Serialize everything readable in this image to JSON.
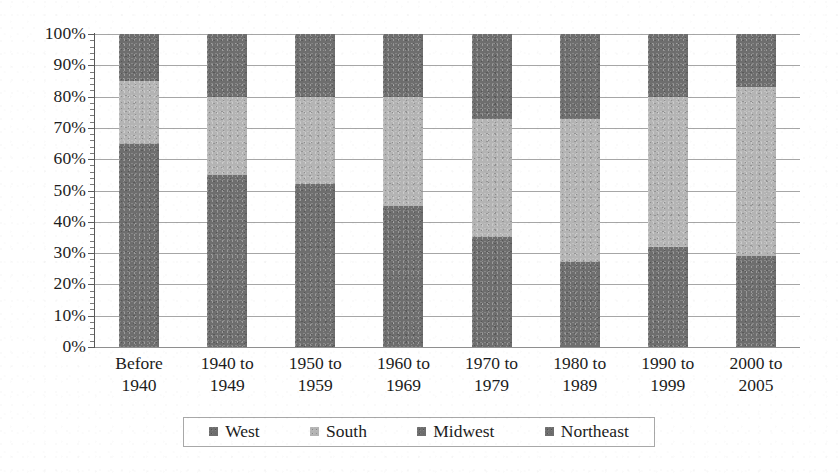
{
  "chart_data": {
    "type": "bar",
    "variant": "stacked-100-percent",
    "title": "",
    "subtitle": "",
    "xlabel": "",
    "ylabel": "",
    "ylim": [
      0,
      100
    ],
    "y_unit": "%",
    "grid": true,
    "legend_position": "bottom",
    "stack_order_bottom_to_top": [
      "Northeast",
      "Midwest",
      "South",
      "West"
    ],
    "categories": [
      "Before 1940",
      "1940 to 1949",
      "1950 to 1959",
      "1960 to 1969",
      "1970 to 1979",
      "1980 to 1989",
      "1990 to 1999",
      "2000 to 2005"
    ],
    "category_lines": [
      [
        "Before",
        "1940"
      ],
      [
        "1940 to",
        "1949"
      ],
      [
        "1950 to",
        "1959"
      ],
      [
        "1960 to",
        "1969"
      ],
      [
        "1970 to",
        "1979"
      ],
      [
        "1980 to",
        "1989"
      ],
      [
        "1990 to",
        "1999"
      ],
      [
        "2000 to",
        "2005"
      ]
    ],
    "ytick_labels": [
      "0%",
      "10%",
      "20%",
      "30%",
      "40%",
      "50%",
      "60%",
      "70%",
      "80%",
      "90%",
      "100%"
    ],
    "ytick_values": [
      0,
      10,
      20,
      30,
      40,
      50,
      60,
      70,
      80,
      90,
      100
    ],
    "series": [
      {
        "name": "West",
        "color": "#6e6e6e",
        "values": [
          15,
          20,
          20,
          20,
          27,
          27,
          20,
          17
        ]
      },
      {
        "name": "South",
        "color": "#b4b4b4",
        "values": [
          20,
          25,
          28,
          35,
          38,
          46,
          48,
          54
        ]
      },
      {
        "name": "Midwest",
        "color": "#6e6e6e",
        "values": [
          30,
          26,
          24,
          21,
          16,
          13,
          14,
          12
        ]
      },
      {
        "name": "Northeast",
        "color": "#6e6e6e",
        "values": [
          35,
          29,
          28,
          24,
          19,
          14,
          18,
          17
        ]
      }
    ],
    "segment_boundaries_percent": {
      "Before 1940": {
        "northeast": [
          0,
          35
        ],
        "midwest": [
          35,
          65
        ],
        "south": [
          65,
          85
        ],
        "west": [
          85,
          100
        ]
      },
      "1940 to 1949": {
        "northeast": [
          0,
          29
        ],
        "midwest": [
          29,
          55
        ],
        "south": [
          55,
          80
        ],
        "west": [
          80,
          100
        ]
      },
      "1950 to 1959": {
        "northeast": [
          0,
          28
        ],
        "midwest": [
          28,
          52
        ],
        "south": [
          52,
          80
        ],
        "west": [
          80,
          100
        ]
      },
      "1960 to 1969": {
        "northeast": [
          0,
          24
        ],
        "midwest": [
          24,
          45
        ],
        "south": [
          45,
          80
        ],
        "west": [
          80,
          100
        ]
      },
      "1970 to 1979": {
        "northeast": [
          0,
          19
        ],
        "midwest": [
          19,
          35
        ],
        "south": [
          35,
          73
        ],
        "west": [
          73,
          100
        ]
      },
      "1980 to 1989": {
        "northeast": [
          0,
          14
        ],
        "midwest": [
          14,
          27
        ],
        "south": [
          27,
          73
        ],
        "west": [
          73,
          100
        ]
      },
      "1990 to 1999": {
        "northeast": [
          0,
          18
        ],
        "midwest": [
          18,
          32
        ],
        "south": [
          32,
          80
        ],
        "west": [
          80,
          100
        ]
      },
      "2000 to 2005": {
        "northeast": [
          0,
          17
        ],
        "midwest": [
          17,
          29
        ],
        "south": [
          29,
          83
        ],
        "west": [
          83,
          100
        ]
      }
    }
  },
  "legend": {
    "items": [
      {
        "label": "West",
        "color": "#6e6e6e",
        "icon": "square-swatch-icon"
      },
      {
        "label": "South",
        "color": "#b4b4b4",
        "icon": "square-swatch-icon"
      },
      {
        "label": "Midwest",
        "color": "#6e6e6e",
        "icon": "square-swatch-icon"
      },
      {
        "label": "Northeast",
        "color": "#6e6e6e",
        "icon": "square-swatch-icon"
      }
    ]
  },
  "style": {
    "plot_background": "#ffffff",
    "gridline_color": "#8d8d8d",
    "axis_color": "#585858",
    "text_color": "#1c1c1c",
    "dark_gray": "#6e6e6e",
    "light_gray": "#b4b4b4"
  }
}
